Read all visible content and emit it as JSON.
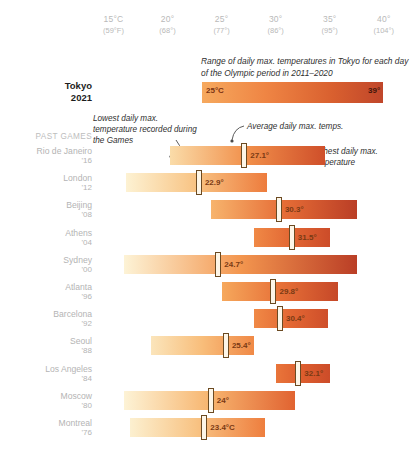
{
  "axis": {
    "ticks": [
      {
        "c": "15°C",
        "f": "(59°F)",
        "x": 15
      },
      {
        "c": "20°",
        "f": "(68°)",
        "x": 20
      },
      {
        "c": "25°",
        "f": "(77°)",
        "x": 25
      },
      {
        "c": "30°",
        "f": "(86°)",
        "x": 30
      },
      {
        "c": "35°",
        "f": "(95°)",
        "x": 35
      },
      {
        "c": "40°",
        "f": "(104°)",
        "x": 40
      }
    ]
  },
  "tokyo": {
    "note": "Range of daily max. temperatures in Tokyo for each day of the Olympic period in 2011–2020",
    "city": "Tokyo",
    "year": "2021",
    "min_label": "25°C",
    "max_label": "39°",
    "min": 25,
    "max": 39
  },
  "annotations": {
    "lowest": "Lowest daily max. temperature recorded during the Games",
    "average": "Average daily max. temps.",
    "highest": "Highest daily max. temperature"
  },
  "past_games_header": "PAST GAMES",
  "chart_data": {
    "type": "bar",
    "title": "Range of daily max. temperatures in Tokyo for each day of the Olympic period in 2011–2020",
    "xlabel": "Temperature",
    "ylabel": "",
    "xlim": [
      13.2,
      41.5
    ],
    "grid": false,
    "legend": "none",
    "value_unit": "°C",
    "axis_ticks_c": [
      15,
      20,
      25,
      30,
      35,
      40
    ],
    "axis_ticks_f": [
      59,
      68,
      77,
      86,
      95,
      104
    ],
    "series_note": "Each bar spans the lowest to highest daily max temperature recorded during those Games; the marker shows the average daily max temperature.",
    "reference_row": {
      "city": "Tokyo",
      "year": "2021",
      "min": 25,
      "max": 39,
      "min_label": "25°C",
      "max_label": "39°"
    },
    "categories": [
      "Rio de Janeiro '16",
      "London '12",
      "Beijing '08",
      "Athens '04",
      "Sydney '00",
      "Atlanta '96",
      "Barcelona '92",
      "Seoul '88",
      "Los Angeles '84",
      "Moscow '80",
      "Montreal '76"
    ],
    "rows": [
      {
        "city": "Rio de Janeiro",
        "year": "'16",
        "min": 20.2,
        "max": 34.6,
        "avg": 27.1,
        "avg_label": "27.1°"
      },
      {
        "city": "London",
        "year": "'12",
        "min": 16.2,
        "max": 29.2,
        "avg": 22.9,
        "avg_label": "22.9°"
      },
      {
        "city": "Beijing",
        "year": "'08",
        "min": 24.0,
        "max": 37.5,
        "avg": 30.3,
        "avg_label": "30.3°"
      },
      {
        "city": "Athens",
        "year": "'04",
        "min": 28.0,
        "max": 35.0,
        "avg": 31.5,
        "avg_label": "31.5°"
      },
      {
        "city": "Sydney",
        "year": "'00",
        "min": 16.0,
        "max": 37.5,
        "avg": 24.7,
        "avg_label": "24.7°"
      },
      {
        "city": "Atlanta",
        "year": "'96",
        "min": 25.0,
        "max": 35.8,
        "avg": 29.8,
        "avg_label": "29.8°"
      },
      {
        "city": "Barcelona",
        "year": "'92",
        "min": 28.0,
        "max": 34.8,
        "avg": 30.4,
        "avg_label": "30.4°"
      },
      {
        "city": "Seoul",
        "year": "'88",
        "min": 18.5,
        "max": 28.0,
        "avg": 25.4,
        "avg_label": "25.4°"
      },
      {
        "city": "Los Angeles",
        "year": "'84",
        "min": 30.0,
        "max": 35.0,
        "avg": 32.1,
        "avg_label": "32.1°"
      },
      {
        "city": "Moscow",
        "year": "'80",
        "min": 16.0,
        "max": 31.8,
        "avg": 24.0,
        "avg_label": "24°"
      },
      {
        "city": "Montreal",
        "year": "'76",
        "min": 16.5,
        "max": 29.0,
        "avg": 23.4,
        "avg_label": "23.4°C"
      }
    ]
  },
  "colors": {
    "cool": "#fbf0cf",
    "mid": "#f5a65c",
    "warm": "#e06a33",
    "hot": "#c0462a",
    "marker_fill": "#fdf6e8",
    "marker_stroke": "#6b4a22",
    "label_grey": "#b4b4b4"
  }
}
